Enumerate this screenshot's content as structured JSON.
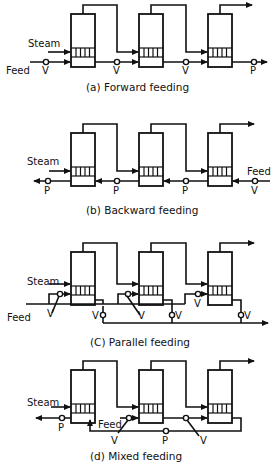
{
  "panels": {
    "a": {
      "caption": "(a) Forward feeding",
      "steam_label": "Steam",
      "feed_label": "Feed",
      "valves": [
        "V",
        "V",
        "V",
        "P"
      ]
    },
    "b": {
      "caption": "(b) Backward feeding",
      "steam_label": "Steam",
      "feed_label": "Feed",
      "valves": [
        "P",
        "P",
        "P",
        "V"
      ]
    },
    "c": {
      "caption": "(C) Parallel feeding",
      "steam_label": "Steam",
      "feed_label": "Feed",
      "valves": [
        "V",
        "V",
        "V",
        "V",
        "V",
        "V"
      ]
    },
    "d": {
      "caption": "(d) Mixed feeding",
      "steam_label": "Steam",
      "feed_label": "Feed",
      "valves": [
        "P",
        "V",
        "P",
        "V"
      ]
    }
  },
  "colors": {
    "line": "#111111",
    "background": "#ffffff"
  }
}
